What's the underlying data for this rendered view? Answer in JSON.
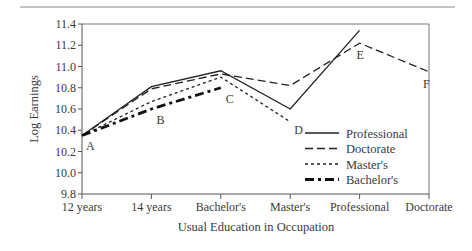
{
  "chart_data": {
    "type": "line",
    "title": "",
    "xlabel": "Usual Education in Occupation",
    "ylabel": "Log Earnings",
    "categories": [
      "12 years",
      "14 years",
      "Bachelor's",
      "Master's",
      "Professional",
      "Doctorate"
    ],
    "yticks": [
      "11.4",
      "11.2",
      "11.0",
      "10.8",
      "10.6",
      "10.4",
      "10.2",
      "10.0",
      "9.8"
    ],
    "ylim": [
      9.8,
      11.4
    ],
    "grid": false,
    "legend_position": "lower right inside",
    "series": [
      {
        "name": "Professional",
        "style": "solid",
        "values": [
          10.35,
          10.81,
          10.96,
          10.6,
          11.34,
          null
        ]
      },
      {
        "name": "Doctorate",
        "style": "long-dash",
        "values": [
          10.35,
          10.79,
          10.93,
          10.82,
          11.22,
          10.95
        ]
      },
      {
        "name": "Master's",
        "style": "short-dash",
        "values": [
          10.35,
          10.67,
          10.9,
          10.48,
          null,
          null
        ]
      },
      {
        "name": "Bachelor's",
        "style": "thick-dash-dot",
        "values": [
          10.35,
          10.6,
          10.8,
          null,
          null,
          null
        ]
      }
    ],
    "annotations": [
      {
        "label": "A",
        "category": "12 years",
        "value": 10.35
      },
      {
        "label": "B",
        "category": "14 years",
        "value": 10.6
      },
      {
        "label": "C",
        "category": "Bachelor's",
        "value": 10.8
      },
      {
        "label": "D",
        "category": "Master's",
        "value": 10.48
      },
      {
        "label": "E",
        "category": "Professional",
        "value": 11.22
      },
      {
        "label": "F",
        "category": "Doctorate",
        "value": 10.95
      }
    ]
  },
  "legend": {
    "items": [
      "Professional",
      "Doctorate",
      "Master's",
      "Bachelor's"
    ]
  }
}
